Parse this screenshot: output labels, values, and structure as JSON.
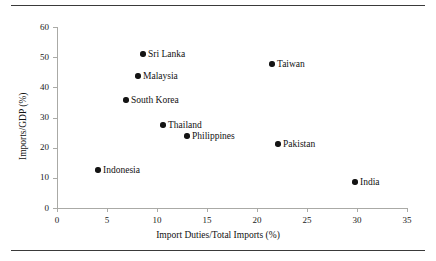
{
  "figure": {
    "top_rule": "horizontal-rule",
    "bottom_rule": "horizontal-rule"
  },
  "chart_data": {
    "type": "scatter",
    "title": "",
    "xlabel": "Import Duties/Total Imports (%)",
    "ylabel": "Imports/GDP (%)",
    "xlim": [
      0,
      35
    ],
    "ylim": [
      0,
      60
    ],
    "xticks": [
      0,
      5,
      10,
      15,
      20,
      25,
      30,
      35
    ],
    "yticks": [
      0,
      10,
      20,
      30,
      40,
      50,
      60
    ],
    "xtick_labels": [
      "0",
      "5",
      "10",
      "15",
      "20",
      "25",
      "30",
      "35"
    ],
    "ytick_labels": [
      "0",
      "10",
      "20",
      "30",
      "40",
      "50",
      "60"
    ],
    "grid": false,
    "legend": "none",
    "marker": "filled-circle",
    "marker_color": "#141414",
    "points": [
      {
        "label": "Sri Lanka",
        "x": 8.6,
        "y": 51.0,
        "label_side": "right"
      },
      {
        "label": "Malaysia",
        "x": 8.1,
        "y": 43.7,
        "label_side": "right"
      },
      {
        "label": "South Korea",
        "x": 6.9,
        "y": 35.8,
        "label_side": "right"
      },
      {
        "label": "Thailand",
        "x": 10.6,
        "y": 27.5,
        "label_side": "right"
      },
      {
        "label": "Philippines",
        "x": 13.0,
        "y": 23.9,
        "label_side": "right"
      },
      {
        "label": "Indonesia",
        "x": 4.1,
        "y": 12.6,
        "label_side": "right"
      },
      {
        "label": "Taiwan",
        "x": 21.5,
        "y": 47.7,
        "label_side": "right"
      },
      {
        "label": "Pakistan",
        "x": 22.1,
        "y": 21.2,
        "label_side": "right"
      },
      {
        "label": "India",
        "x": 29.8,
        "y": 8.6,
        "label_side": "right"
      }
    ]
  }
}
